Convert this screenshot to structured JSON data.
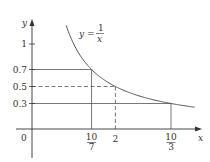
{
  "chart_data": {
    "type": "line",
    "title": "",
    "xlabel": "x",
    "ylabel": "y",
    "function_label": {
      "lhs": "y =",
      "num": "1",
      "den": "x"
    },
    "function": "1/x",
    "x_range": [
      0.82,
      3.9
    ],
    "xlim": [
      -0.4,
      4.0
    ],
    "ylim": [
      -0.35,
      1.3
    ],
    "grid": false,
    "legend": null,
    "origin_label": "0",
    "y_ticks": [
      {
        "value": 1,
        "label": "1"
      },
      {
        "value": 0.7,
        "label": "0.7"
      },
      {
        "value": 0.5,
        "label": "0.5"
      },
      {
        "value": 0.3,
        "label": "0.3"
      }
    ],
    "x_ticks": [
      {
        "value": 1.4286,
        "num": "10",
        "den": "7"
      },
      {
        "value": 2,
        "label": "2"
      },
      {
        "value": 3.3333,
        "num": "10",
        "den": "3"
      }
    ],
    "reference_lines": [
      {
        "y": 0.7,
        "x": 1.4286,
        "style": "solid"
      },
      {
        "y": 0.5,
        "x": 2,
        "style": "dashed"
      },
      {
        "y": 0.3,
        "x": 3.3333,
        "style": "solid"
      }
    ]
  },
  "colors": {
    "axis": "#333333",
    "curve": "#555555",
    "guides": "#555555"
  }
}
